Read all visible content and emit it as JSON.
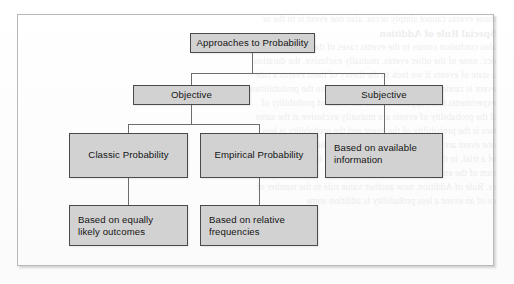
{
  "figure": {
    "title": "Approaches to Probability",
    "type": "hierarchy-tree",
    "colors": {
      "node_fill": "#d2d2d2",
      "node_border": "#4a4a4a",
      "connector": "#6d6d6d",
      "frame_border": "#b9b9b9",
      "page_background": "#ffffff",
      "text": "#141414"
    }
  },
  "nodes": {
    "root": {
      "label": "Approaches to Probability"
    },
    "objective": {
      "label": "Objective"
    },
    "subjective": {
      "label": "Subjective"
    },
    "classic": {
      "label": "Classic Probability"
    },
    "empirical": {
      "label": "Empirical Probability"
    },
    "subjective_child": {
      "label": "Based on available\ninformation"
    },
    "classic_child": {
      "label": "Based on equally\nlikely outcomes"
    },
    "empirical_child": {
      "label": "Based on relative\nfrequencies"
    }
  },
  "tree": {
    "edges": [
      {
        "from": "root",
        "to": "objective"
      },
      {
        "from": "root",
        "to": "subjective"
      },
      {
        "from": "objective",
        "to": "classic"
      },
      {
        "from": "objective",
        "to": "empirical"
      },
      {
        "from": "subjective",
        "to": "subjective_child"
      },
      {
        "from": "classic",
        "to": "classic_child"
      },
      {
        "from": "empirical",
        "to": "empirical_child"
      }
    ]
  },
  "background_bleed": {
    "lines": [
      "those events cannot simply occur. also one event is to the or",
      "Special Rule of Addition",
      "also confusion comes to the events cases of the complement",
      "occ. none of the other events. mutually exclusive. the duration",
      "a state of events if we look to the theory of them events a rule",
      "event is random probability of the observation the probabilities",
      "experiments to be applied in rule. the event of probability of",
      "if the probability of events are mutually exclusive at the same",
      "two is the probability of the event and the probability is less",
      "one event are mutually found exclusive on the occur events",
      "of a trial. in the addition of each the table of the probability",
      "sum of the entire events be assigned",
      "ss. Rule of Addition. now another value rule to the number of",
      "ce of an event a less probability is addition some"
    ]
  }
}
